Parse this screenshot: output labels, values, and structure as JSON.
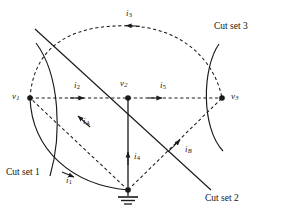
{
  "figure": {
    "type": "circuit-graph-cutset-diagram",
    "background": "#ffffff",
    "stroke_color": "#1a1a1a",
    "width": 282,
    "height": 215
  },
  "nodes": [
    {
      "id": "v1",
      "label_main": "v",
      "label_sub": "1",
      "x": 30,
      "y": 98,
      "label_x": 12,
      "label_y": 92
    },
    {
      "id": "v2",
      "label_main": "v",
      "label_sub": "2",
      "x": 128,
      "y": 98,
      "label_x": 120,
      "label_y": 80
    },
    {
      "id": "v3",
      "label_main": "v",
      "label_sub": "3",
      "x": 222,
      "y": 98,
      "label_x": 231,
      "label_y": 92
    },
    {
      "id": "ground",
      "label_main": "",
      "label_sub": "",
      "x": 128,
      "y": 190
    }
  ],
  "branch_labels": [
    {
      "id": "i1",
      "main": "i",
      "sub": "1",
      "x": 66,
      "y": 176
    },
    {
      "id": "i2",
      "main": "i",
      "sub": "2",
      "x": 74,
      "y": 82
    },
    {
      "id": "i3",
      "main": "i",
      "sub": "3",
      "x": 126,
      "y": 12
    },
    {
      "id": "i4",
      "main": "i",
      "sub": "4",
      "x": 134,
      "y": 152
    },
    {
      "id": "i5",
      "main": "i",
      "sub": "5",
      "x": 160,
      "y": 82
    },
    {
      "id": "iA",
      "main": "i",
      "sub": "A",
      "x": 83,
      "y": 117
    },
    {
      "id": "iB",
      "main": "i",
      "sub": "B",
      "x": 185,
      "y": 145
    }
  ],
  "cut_sets": [
    {
      "id": "cut-set-1",
      "label": "Cut set 1",
      "x": 6,
      "y": 168
    },
    {
      "id": "cut-set-2",
      "label": "Cut set 2",
      "x": 205,
      "y": 194
    },
    {
      "id": "cut-set-3",
      "label": "Cut set 3",
      "x": 214,
      "y": 22
    }
  ],
  "edges": [
    {
      "id": "edge-v1-v2",
      "style": "dashed",
      "from": "v1",
      "to": "v2",
      "current": "i2"
    },
    {
      "id": "edge-v2-v3",
      "style": "dashed",
      "from": "v2",
      "to": "v3",
      "current": "i5"
    },
    {
      "id": "edge-v3-v1-arc",
      "style": "dashed",
      "from": "v3",
      "to": "v1",
      "current": "i3"
    },
    {
      "id": "edge-v1-ground",
      "style": "solid",
      "from": "v1",
      "to": "ground",
      "current": "i1"
    },
    {
      "id": "edge-v2-ground",
      "style": "solid",
      "from": "v2",
      "to": "ground",
      "current": "i4"
    },
    {
      "id": "edge-ground-v1-chord",
      "style": "dashed",
      "from": "ground",
      "to": "v1",
      "current": "iA"
    },
    {
      "id": "edge-ground-v3-chord",
      "style": "dashed",
      "from": "ground",
      "to": "v3",
      "current": "iB"
    }
  ]
}
